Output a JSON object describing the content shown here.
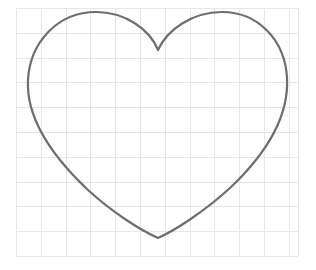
{
  "canvas": {
    "width": 316,
    "height": 270,
    "background_color": "#ffffff",
    "title": "Hand-drawn heart outline on graph paper"
  },
  "grid": {
    "name": "graph-paper-grid",
    "line_color": "#e6e6e6",
    "line_width": 1,
    "cell_width": 24.8,
    "cell_height": 24.8,
    "origin_x": 16,
    "origin_y": 8,
    "right": 298,
    "bottom": 256,
    "columns": 11,
    "rows": 10
  },
  "shape": {
    "name": "heart-outline",
    "stroke_color": "#6e6e6e",
    "stroke_width": 2.2,
    "fill": "none",
    "line_style": "solid",
    "cusp_point": {
      "x": 158,
      "y": 50
    },
    "bottom_tip": {
      "x": 158,
      "y": 238
    },
    "left_lobe_apex": {
      "x": 82,
      "y": 15
    },
    "right_lobe_apex": {
      "x": 240,
      "y": 14
    },
    "leftmost_point": {
      "x": 28,
      "y": 78
    },
    "rightmost_point": {
      "x": 287,
      "y": 76
    },
    "path": "M158,50 C150,30 126,12 96,12 C58,12 30,42 28,80 C26,118 52,156 88,190 C112,212 140,230 158,238 C176,230 206,210 230,188 C266,154 289,116 287,78 C285,40 258,12 222,12 C192,12 167,30 158,50 Z"
  }
}
